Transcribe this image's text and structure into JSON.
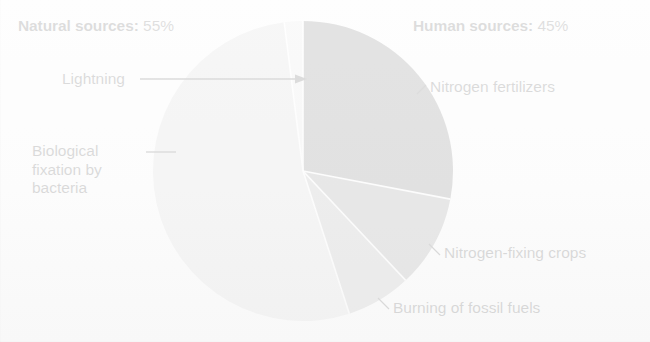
{
  "figure": {
    "background_color": "#fdfdfd"
  },
  "headings": {
    "natural": {
      "label": "Natural sources:",
      "value": "55%"
    },
    "human": {
      "label": "Human sources:",
      "value": "45%"
    }
  },
  "labels": {
    "lightning": "Lightning",
    "biological": "Biological fixation by bacteria",
    "nitrogen_fertilizers": "Nitrogen fertilizers",
    "nitrogen_fixing_crops": "Nitrogen-fixing crops",
    "burning_fossil_fuels": "Burning of fossil fuels"
  },
  "chart_data": {
    "type": "pie",
    "title": "",
    "subtitle": "",
    "xlabel": "",
    "ylabel": "",
    "grid": false,
    "legend_position": "callout-labels",
    "start_angle_deg": 0,
    "direction": "clockwise",
    "center": {
      "x": 303,
      "y": 171
    },
    "radius": 151,
    "groups": [
      {
        "name": "Natural sources",
        "value": 55,
        "display": "55%"
      },
      {
        "name": "Human sources",
        "value": 45,
        "display": "45%"
      }
    ],
    "categories": [
      "Nitrogen fertilizers",
      "Nitrogen-fixing crops",
      "Burning of fossil fuels",
      "Biological fixation by bacteria",
      "Lightning"
    ],
    "values": [
      28,
      10,
      7,
      53,
      2
    ],
    "slices": [
      {
        "label": "Nitrogen fertilizers",
        "group": "Human sources",
        "value": 28,
        "start_deg": 0,
        "end_deg": 100.8,
        "color": "#4a4a4a"
      },
      {
        "label": "Nitrogen-fixing crops",
        "group": "Human sources",
        "value": 10,
        "start_deg": 100.8,
        "end_deg": 136.8,
        "color": "#757575"
      },
      {
        "label": "Burning of fossil fuels",
        "group": "Human sources",
        "value": 7,
        "start_deg": 136.8,
        "end_deg": 162.0,
        "color": "#9b9b9b"
      },
      {
        "label": "Biological fixation by bacteria",
        "group": "Natural sources",
        "value": 53,
        "start_deg": 162.0,
        "end_deg": 352.8,
        "color": "#cdcdcd"
      },
      {
        "label": "Lightning",
        "group": "Natural sources",
        "value": 2,
        "start_deg": 352.8,
        "end_deg": 360.0,
        "color": "#dedede"
      }
    ],
    "ylim": [
      0,
      100
    ]
  },
  "colors": {
    "nitrogen_fertilizers": "#4a4a4a",
    "nitrogen_fixing_crops": "#757575",
    "burning_fossil_fuels": "#9b9b9b",
    "biological_fixation": "#cdcdcd",
    "lightning": "#dedede",
    "text": "#141414",
    "leader_line": "#1a1a1a",
    "background": "#fdfdfd"
  }
}
